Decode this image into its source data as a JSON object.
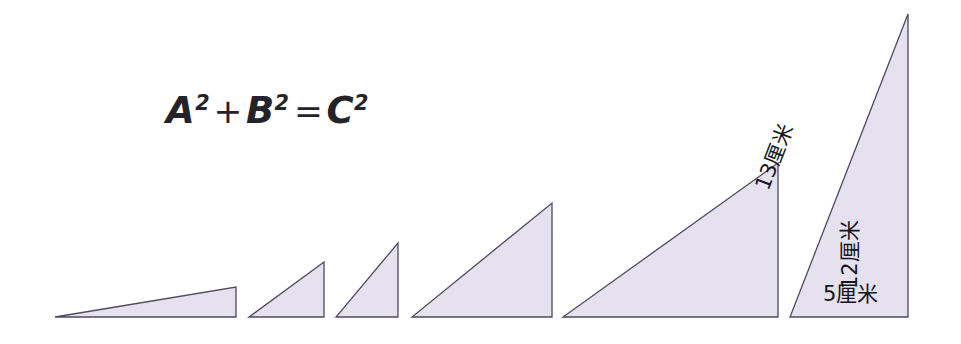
{
  "figure": {
    "background_color": "#ffffff",
    "width": 961,
    "height": 344,
    "baseline_y": 318
  },
  "equation": {
    "full_text": "A2 + B2 = C2",
    "a": "A",
    "a_exp": "2",
    "plus": "+",
    "b": "B",
    "b_exp": "2",
    "equals": "=",
    "c": "C",
    "c_exp": "2",
    "color": "#24232a"
  },
  "style": {
    "fill": "#e5e1ef",
    "stroke": "#4f4a5e",
    "stroke_width": "1.3",
    "label_color": "#16151a"
  },
  "labels": {
    "hypotenuse": "13厘米",
    "vertical": "12厘米",
    "base": "5厘米"
  },
  "chart_data": {
    "type": "diagram",
    "shape": "right-triangle",
    "shared_baseline_y": 318,
    "orientation": "right angle at bottom-right, apex at top-right, hypotenuse rising left-to-right",
    "triangles": [
      {
        "index": 1,
        "name": "triangle-1",
        "points": "55,317 236,317 236,287",
        "base_px": 181,
        "height_px": 30,
        "labeled": false
      },
      {
        "index": 2,
        "name": "triangle-2",
        "points": "249,317 324,317 324,262",
        "base_px": 75,
        "height_px": 55,
        "labeled": false
      },
      {
        "index": 3,
        "name": "triangle-3",
        "points": "336,317 398,317 398,243",
        "base_px": 62,
        "height_px": 74,
        "labeled": false
      },
      {
        "index": 4,
        "name": "triangle-4",
        "points": "412,317 552,317 552,203",
        "base_px": 140,
        "height_px": 114,
        "labeled": false
      },
      {
        "index": 5,
        "name": "triangle-5",
        "points": "563,317 778,317 778,163",
        "base_px": 215,
        "height_px": 154,
        "labeled": false
      },
      {
        "index": 6,
        "name": "triangle-6-labeled",
        "points": "790,317 908,317 908,14",
        "base_px": 118,
        "height_px": 303,
        "labeled": true,
        "side_labels": {
          "base": "5厘米",
          "vertical": "12厘米",
          "hypotenuse": "13厘米"
        }
      }
    ]
  }
}
